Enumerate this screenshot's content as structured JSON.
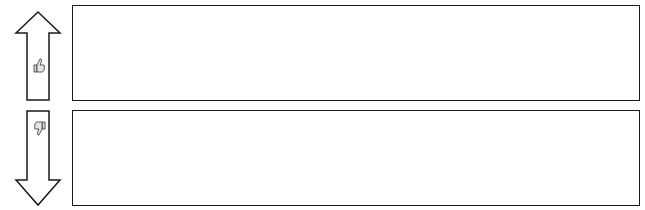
{
  "diagram": {
    "top_section": {
      "arrow_direction": "up",
      "icon": "thumbs-up-icon",
      "box_text": ""
    },
    "bottom_section": {
      "arrow_direction": "down",
      "icon": "thumbs-down-icon",
      "box_text": ""
    },
    "colors": {
      "stroke": "#1a1a1a",
      "background": "#ffffff",
      "icon_fill": "#cccccc"
    }
  }
}
